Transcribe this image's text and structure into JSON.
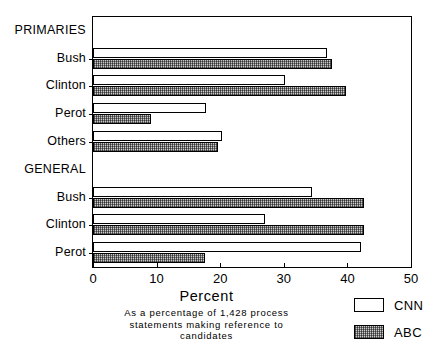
{
  "chart_data": {
    "type": "bar",
    "orientation": "horizontal",
    "title": "",
    "xlabel": "Percent",
    "ylabel": "",
    "xlim": [
      0,
      50
    ],
    "xticks": [
      0,
      10,
      20,
      30,
      40,
      50
    ],
    "xtick_labels": [
      "0",
      "10",
      "20",
      "30",
      "40",
      "50"
    ],
    "grid": false,
    "legend_position": "bottom-right",
    "caption": "As a percentage of 1,428 process statements making reference to candidates",
    "caption_lines": [
      "As a percentage of 1,428 process",
      "statements making reference to",
      "candidates"
    ],
    "groups": [
      {
        "name": "PRIMARIES",
        "categories": [
          "Bush",
          "Clinton",
          "Perot",
          "Others"
        ]
      },
      {
        "name": "GENERAL",
        "categories": [
          "Bush",
          "Clinton",
          "Perot"
        ]
      }
    ],
    "categories": [
      "PRIMARIES",
      "Bush",
      "Clinton",
      "Perot",
      "Others",
      "GENERAL",
      "Bush",
      "Clinton",
      "Perot"
    ],
    "series": [
      {
        "name": "CNN",
        "color": "#ffffff",
        "values": [
          null,
          36.8,
          30.2,
          17.7,
          20.3,
          null,
          34.4,
          27.0,
          42.2
        ]
      },
      {
        "name": "ABC",
        "color": "#c9c9c9",
        "values": [
          null,
          37.6,
          39.8,
          9.1,
          19.7,
          null,
          42.6,
          42.6,
          17.6
        ]
      }
    ],
    "rows": [
      {
        "label": "PRIMARIES",
        "is_group": true,
        "cnn": null,
        "abc": null
      },
      {
        "label": "Bush",
        "is_group": false,
        "cnn": 36.8,
        "abc": 37.6
      },
      {
        "label": "Clinton",
        "is_group": false,
        "cnn": 30.2,
        "abc": 39.8
      },
      {
        "label": "Perot",
        "is_group": false,
        "cnn": 17.7,
        "abc": 9.1
      },
      {
        "label": "Others",
        "is_group": false,
        "cnn": 20.3,
        "abc": 19.7
      },
      {
        "label": "GENERAL",
        "is_group": true,
        "cnn": null,
        "abc": null
      },
      {
        "label": "Bush",
        "is_group": false,
        "cnn": 34.4,
        "abc": 42.6
      },
      {
        "label": "Clinton",
        "is_group": false,
        "cnn": 27.0,
        "abc": 42.6
      },
      {
        "label": "Perot",
        "is_group": false,
        "cnn": 42.2,
        "abc": 17.6
      }
    ],
    "legend": [
      {
        "label": "CNN",
        "swatch": "white"
      },
      {
        "label": "ABC",
        "swatch": "hatched"
      }
    ]
  }
}
